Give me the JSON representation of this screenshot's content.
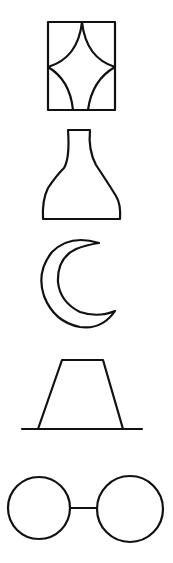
{
  "figure": {
    "title": "",
    "background": "#ffffff",
    "stroke_color": "#111111",
    "shapes": [
      {
        "id": "shape-1",
        "kind": "rectangle-with-concave-diamond",
        "label": ""
      },
      {
        "id": "shape-2",
        "kind": "bottle-vase",
        "label": ""
      },
      {
        "id": "shape-3",
        "kind": "crescent-moon",
        "label": ""
      },
      {
        "id": "shape-4",
        "kind": "trapezoid-on-baseline",
        "label": ""
      },
      {
        "id": "shape-5",
        "kind": "two-circles-connected",
        "label": ""
      }
    ]
  }
}
